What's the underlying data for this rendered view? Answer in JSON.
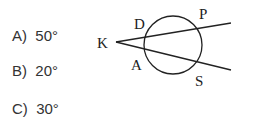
{
  "options": [
    {
      "label": "A)",
      "value": "50°"
    },
    {
      "label": "B)",
      "value": "20°"
    },
    {
      "label": "C)",
      "value": "30°"
    }
  ],
  "diagram": {
    "points": {
      "K": "K",
      "D": "D",
      "P": "P",
      "A": "A",
      "S": "S"
    }
  }
}
